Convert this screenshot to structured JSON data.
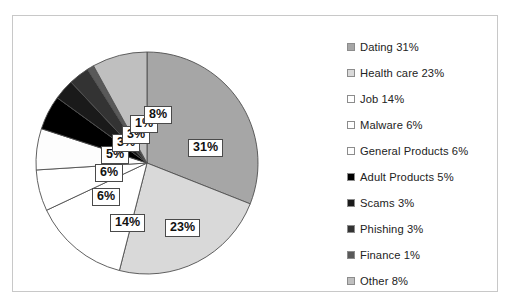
{
  "chart_data": {
    "type": "pie",
    "title": "",
    "labels": [
      "Dating",
      "Health care",
      "Job",
      "Malware",
      "General Products",
      "Adult Products",
      "Scams",
      "Phishing",
      "Finance",
      "Other"
    ],
    "values": [
      31,
      23,
      14,
      6,
      6,
      5,
      3,
      3,
      1,
      8
    ],
    "value_suffix": "%",
    "colors": [
      "#a6a6a6",
      "#d9d9d9",
      "#ffffff",
      "#ffffff",
      "#fdfdfd",
      "#000000",
      "#1a1a1a",
      "#333333",
      "#595959",
      "#bfbfbf"
    ],
    "start_angle_deg": 0,
    "direction": "clockwise",
    "legend_position": "right",
    "grid": false,
    "data_labels_shown": true
  },
  "legend": {
    "items": [
      {
        "label": "Dating 31%",
        "swatch": "#a6a6a6",
        "name": "dating"
      },
      {
        "label": "Health care 23%",
        "swatch": "#d9d9d9",
        "name": "health-care"
      },
      {
        "label": "Job 14%",
        "swatch": "#ffffff",
        "name": "job"
      },
      {
        "label": "Malware 6%",
        "swatch": "#ffffff",
        "name": "malware"
      },
      {
        "label": "General Products 6%",
        "swatch": "#fdfdfd",
        "name": "general-products"
      },
      {
        "label": "Adult Products 5%",
        "swatch": "#000000",
        "name": "adult-products"
      },
      {
        "label": "Scams 3%",
        "swatch": "#1a1a1a",
        "name": "scams"
      },
      {
        "label": "Phishing 3%",
        "swatch": "#333333",
        "name": "phishing"
      },
      {
        "label": "Finance 1%",
        "swatch": "#595959",
        "name": "finance"
      },
      {
        "label": "Other 8%",
        "swatch": "#bfbfbf",
        "name": "other"
      }
    ]
  },
  "pie_labels": [
    {
      "text": "31%",
      "name": "dating",
      "left": 175,
      "top": 123
    },
    {
      "text": "23%",
      "name": "health-care",
      "left": 152,
      "top": 203
    },
    {
      "text": "14%",
      "name": "job",
      "left": 97,
      "top": 198
    },
    {
      "text": "6%",
      "name": "general-products",
      "left": 79,
      "top": 172
    },
    {
      "text": "6%",
      "name": "malware",
      "left": 82,
      "top": 148
    },
    {
      "text": "5%",
      "name": "adult-products",
      "left": 88,
      "top": 130
    },
    {
      "text": "3%",
      "name": "scams",
      "left": 99,
      "top": 118
    },
    {
      "text": "3%",
      "name": "phishing",
      "left": 109,
      "top": 110
    },
    {
      "text": "1%",
      "name": "finance",
      "left": 117,
      "top": 99
    },
    {
      "text": "8%",
      "name": "other",
      "left": 131,
      "top": 90
    }
  ]
}
